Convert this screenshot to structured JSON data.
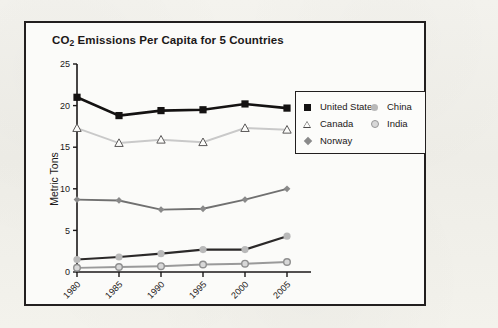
{
  "chart_data": {
    "type": "line",
    "title": "CO2 Emissions Per Capita for 5 Countries",
    "title_main": "CO",
    "title_sub": "2",
    "title_rest": " Emissions Per Capita for 5 Countries",
    "xlabel": "",
    "ylabel": "Metric Tons",
    "categories": [
      "1980",
      "1985",
      "1990",
      "1995",
      "2000",
      "2005"
    ],
    "ylim": [
      0,
      25
    ],
    "yticks": [
      "0",
      "5",
      "10",
      "15",
      "20",
      "25"
    ],
    "grid": false,
    "legend_position": "upper-right-inside",
    "series": [
      {
        "name": "United States",
        "marker": "filled-square",
        "color": "#141212",
        "line_color": "#141212",
        "values": [
          21.0,
          18.8,
          19.4,
          19.5,
          20.2,
          19.7
        ]
      },
      {
        "name": "Canada",
        "marker": "open-triangle",
        "color": "#fcfcfa",
        "line_color": "#c9c9c9",
        "values": [
          17.3,
          15.5,
          15.9,
          15.6,
          17.3,
          17.1
        ]
      },
      {
        "name": "Norway",
        "marker": "filled-diamond",
        "color": "#8a8a8a",
        "line_color": "#707070",
        "values": [
          8.7,
          8.6,
          7.5,
          7.6,
          8.7,
          10.0
        ]
      },
      {
        "name": "China",
        "marker": "filled-circle",
        "color": "#b9b9b9",
        "line_color": "#2b2929",
        "values": [
          1.5,
          1.8,
          2.2,
          2.7,
          2.7,
          4.3
        ]
      },
      {
        "name": "India",
        "marker": "donut-circle",
        "color": "#d8d8d8",
        "line_color": "#9a9a9a",
        "values": [
          0.5,
          0.6,
          0.7,
          0.9,
          1.0,
          1.2
        ]
      }
    ]
  },
  "legend": {
    "left_column": [
      "United States",
      "Canada",
      "Norway"
    ],
    "right_column": [
      "China",
      "India"
    ]
  }
}
